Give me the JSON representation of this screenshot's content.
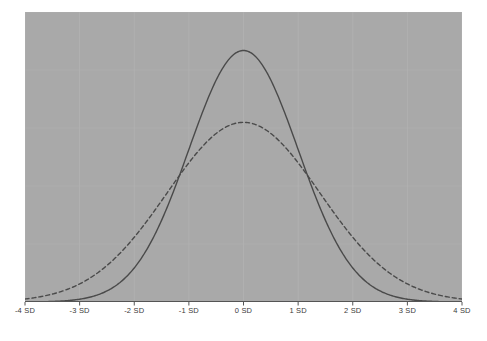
{
  "figure": {
    "background_color": "#ffffff",
    "panel_color": "#a9a9a9",
    "panel_grid_color": "#b2b2b2",
    "axis_line_color": "#555555",
    "tick_label_color": "#3a3a3a"
  },
  "chart_data": {
    "type": "line",
    "title": "",
    "subtitle": "",
    "xlabel": "",
    "ylabel": "",
    "grid": true,
    "legend": null,
    "legend_position": "none",
    "xlim": [
      -4,
      4
    ],
    "ylim": [
      0,
      0.46
    ],
    "x_tick_values": [
      -4,
      -3,
      -2,
      -1,
      0,
      1,
      2,
      3,
      4
    ],
    "x_tick_labels": [
      "-4 SD",
      "-3 SD",
      "-2 SD",
      "-1 SD",
      "0 SD",
      "1 SD",
      "2 SD",
      "3 SD",
      "4 SD"
    ],
    "y_tick_labels": [],
    "series": [
      {
        "name": "narrow-normal",
        "style": "solid",
        "color": "#4a4a4a",
        "line_width": 1.4,
        "mean": 0,
        "sd": 1.0,
        "peak_value": 0.399,
        "x": [
          -4,
          -3.75,
          -3.5,
          -3.25,
          -3,
          -2.75,
          -2.5,
          -2.25,
          -2,
          -1.75,
          -1.5,
          -1.25,
          -1,
          -0.75,
          -0.5,
          -0.25,
          0,
          0.25,
          0.5,
          0.75,
          1,
          1.25,
          1.5,
          1.75,
          2,
          2.25,
          2.5,
          2.75,
          3,
          3.25,
          3.5,
          3.75,
          4
        ],
        "values": [
          0.0001,
          0.0003,
          0.0009,
          0.002,
          0.0044,
          0.0091,
          0.0175,
          0.0317,
          0.054,
          0.0863,
          0.1295,
          0.1826,
          0.242,
          0.3011,
          0.3521,
          0.3867,
          0.3989,
          0.3867,
          0.3521,
          0.3011,
          0.242,
          0.1826,
          0.1295,
          0.0863,
          0.054,
          0.0317,
          0.0175,
          0.0091,
          0.0044,
          0.002,
          0.0009,
          0.0003,
          0.0001
        ]
      },
      {
        "name": "wide-normal",
        "style": "dashed",
        "color": "#4a4a4a",
        "line_width": 1.4,
        "dash_pattern": "4,3",
        "mean": 0,
        "sd": 1.4,
        "peak_value": 0.285,
        "x": [
          -4,
          -3.75,
          -3.5,
          -3.25,
          -3,
          -2.75,
          -2.5,
          -2.25,
          -2,
          -1.75,
          -1.5,
          -1.25,
          -1,
          -0.75,
          -0.5,
          -0.25,
          0,
          0.25,
          0.5,
          0.75,
          1,
          1.25,
          1.5,
          1.75,
          2,
          2.25,
          2.5,
          2.75,
          3,
          3.25,
          3.5,
          3.75,
          4
        ],
        "values": [
          0.0047,
          0.0078,
          0.0124,
          0.0191,
          0.0283,
          0.0406,
          0.0562,
          0.0752,
          0.0973,
          0.1216,
          0.1468,
          0.1713,
          0.1932,
          0.2106,
          0.2222,
          0.2268,
          0.2266,
          0.2268,
          0.2222,
          0.2106,
          0.1932,
          0.1713,
          0.1468,
          0.1216,
          0.0973,
          0.0752,
          0.0562,
          0.0406,
          0.0283,
          0.0191,
          0.0124,
          0.0078,
          0.0047
        ]
      }
    ],
    "annotations": []
  }
}
